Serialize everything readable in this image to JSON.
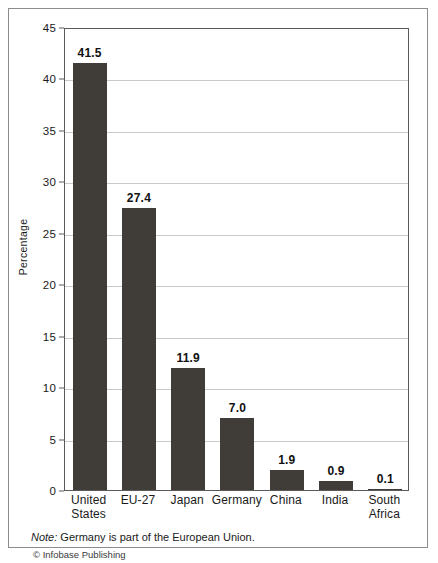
{
  "chart_data": {
    "type": "bar",
    "title": "",
    "xlabel": "",
    "ylabel": "Percentage",
    "ylim": [
      0,
      45
    ],
    "ytick_step": 5,
    "grid": true,
    "legend": "none",
    "categories": [
      "United States",
      "EU-27",
      "Japan",
      "Germany",
      "China",
      "India",
      "South Africa"
    ],
    "category_lines": [
      [
        "United",
        "States"
      ],
      [
        "EU-27"
      ],
      [
        "Japan"
      ],
      [
        "Germany"
      ],
      [
        "China"
      ],
      [
        "India"
      ],
      [
        "South",
        "Africa"
      ]
    ],
    "values": [
      41.5,
      27.4,
      11.9,
      7.0,
      1.9,
      0.9,
      0.1
    ],
    "value_labels": [
      "41.5",
      "27.4",
      "11.9",
      "7.0",
      "1.9",
      "0.9",
      "0.1"
    ],
    "yticks": [
      {
        "value": 45,
        "label": "45"
      },
      {
        "value": 40,
        "label": "40"
      },
      {
        "value": 35,
        "label": "35"
      },
      {
        "value": 30,
        "label": "30"
      },
      {
        "value": 25,
        "label": "25"
      },
      {
        "value": 20,
        "label": "20"
      },
      {
        "value": 15,
        "label": "15"
      },
      {
        "value": 10,
        "label": "10"
      },
      {
        "value": 5,
        "label": "5"
      },
      {
        "value": 0,
        "label": "0"
      }
    ],
    "colors": {
      "bar": "#403d39",
      "gridline": "#c9c9c9",
      "axis": "#5a5a5a",
      "frame": "#8d8d8d",
      "background": "#ffffff",
      "text": "#1a1a1a"
    }
  },
  "footer": {
    "note_lead": "Note:",
    "note_text": " Germany is part of the European Union.",
    "credit": "© Infobase Publishing"
  }
}
